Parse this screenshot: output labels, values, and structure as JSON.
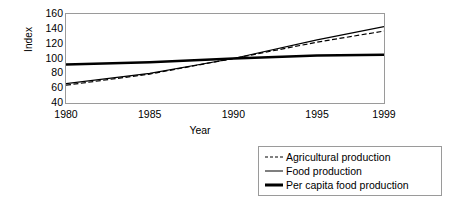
{
  "chart_data": {
    "type": "line",
    "title": "",
    "xlabel": "Year",
    "ylabel": "Index",
    "xlim": [
      1980,
      1999
    ],
    "ylim": [
      40,
      160
    ],
    "ytick_step": 20,
    "grid": false,
    "legend_position": "bottom-right",
    "x": [
      1980,
      1985,
      1990,
      1995,
      1999
    ],
    "xtick_labels": [
      "1980",
      "1985",
      "1990",
      "1995",
      "1999"
    ],
    "ytick_labels": [
      "160",
      "140",
      "120",
      "100",
      "80",
      "60",
      "40"
    ],
    "ytick_values": [
      160,
      140,
      120,
      100,
      80,
      60,
      40
    ],
    "series": [
      {
        "name": "Agricultural production",
        "style": "dashed",
        "width": "thin",
        "values": [
          64,
          79,
          100,
          122,
          137
        ]
      },
      {
        "name": "Food production",
        "style": "solid",
        "width": "thin",
        "values": [
          66,
          80,
          100,
          125,
          143
        ]
      },
      {
        "name": "Per capita food production",
        "style": "solid",
        "width": "thick",
        "values": [
          92,
          95,
          100,
          104,
          105
        ]
      }
    ]
  },
  "legend": {
    "items": [
      {
        "label": "Agricultural production",
        "key": "dashed-line-key"
      },
      {
        "label": "Food production",
        "key": "thin-line-key"
      },
      {
        "label": "Per capita food production",
        "key": "thick-line-key"
      }
    ]
  },
  "axes": {
    "y_title": "Index",
    "x_title": "Year"
  }
}
